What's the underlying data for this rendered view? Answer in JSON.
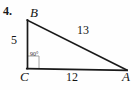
{
  "problem": {
    "number": "4."
  },
  "figure": {
    "type": "right-triangle",
    "vertices": [
      {
        "name": "B",
        "label": "B",
        "x": 27,
        "y": 20
      },
      {
        "name": "C",
        "label": "C",
        "x": 27,
        "y": 68
      },
      {
        "name": "A",
        "label": "A",
        "x": 126,
        "y": 70
      }
    ],
    "sides": [
      {
        "name": "leg-vertical",
        "from": "B",
        "to": "C",
        "label": "5"
      },
      {
        "name": "leg-horizontal",
        "from": "C",
        "to": "A",
        "label": "12"
      },
      {
        "name": "hypotenuse",
        "from": "B",
        "to": "A",
        "label": "13"
      }
    ],
    "angles": [
      {
        "at": "C",
        "label": "90°",
        "marker": "right-angle-square"
      }
    ],
    "stroke_color": "#1a1a1a",
    "marker_color": "#8c8c8c",
    "background_color": "#fefefe"
  }
}
